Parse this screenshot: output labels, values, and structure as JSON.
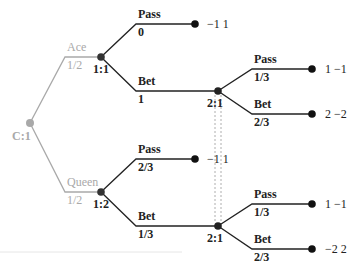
{
  "diagram": {
    "type": "extensive-form game tree",
    "colors": {
      "chance": "#a9a9a9",
      "player": "#222222",
      "infoset": "#999999"
    },
    "root": {
      "label": "C:1"
    },
    "chance_moves": [
      {
        "action": "Ace",
        "prob": "1/2",
        "node": "1:1"
      },
      {
        "action": "Queen",
        "prob": "1/2",
        "node": "1:2"
      }
    ],
    "ace": {
      "pass": {
        "action": "Pass",
        "prob": "0",
        "payoff": "−1 1"
      },
      "bet": {
        "action": "Bet",
        "prob": "1",
        "node": "2:1"
      },
      "p2": {
        "pass": {
          "action": "Pass",
          "prob": "1/3",
          "payoff": "1 −1"
        },
        "bet": {
          "action": "Bet",
          "prob": "2/3",
          "payoff": "2 −2"
        }
      }
    },
    "queen": {
      "pass": {
        "action": "Pass",
        "prob": "2/3",
        "payoff": "−1 1"
      },
      "bet": {
        "action": "Bet",
        "prob": "1/3",
        "node": "2:1"
      },
      "p2": {
        "pass": {
          "action": "Pass",
          "prob": "1/3",
          "payoff": "1 −1"
        },
        "bet": {
          "action": "Bet",
          "prob": "2/3",
          "payoff": "−2 2"
        }
      }
    }
  }
}
